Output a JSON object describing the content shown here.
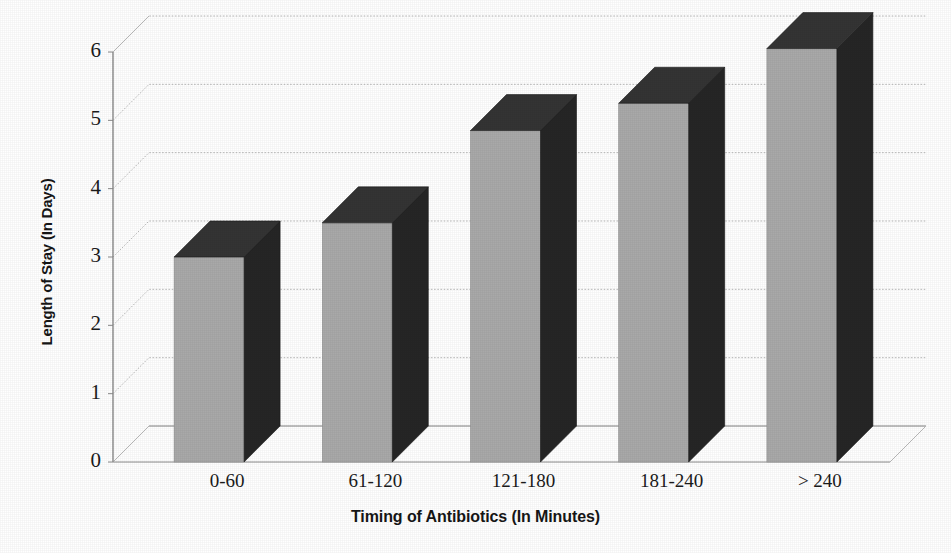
{
  "chart_data": {
    "type": "bar",
    "title": "",
    "subtitle": "",
    "xlabel": "Timing of Antibiotics (In Minutes)",
    "ylabel": "Length of Stay (In Days)",
    "categories": [
      "0-60",
      "61-120",
      "121-180",
      "181-240",
      "> 240"
    ],
    "values": [
      3.0,
      3.5,
      4.85,
      5.25,
      6.05
    ],
    "series": [
      {
        "name": "Length of Stay",
        "values": [
          3.0,
          3.5,
          4.85,
          5.25,
          6.05
        ]
      }
    ],
    "ylim": [
      0,
      6
    ],
    "yticks": [
      0,
      1,
      2,
      3,
      4,
      5,
      6
    ],
    "ytick_labels": [
      "0",
      "1",
      "2",
      "3",
      "4",
      "5",
      "6"
    ],
    "grid": true,
    "grid_axis": "y",
    "legend": false,
    "legend_position": "none",
    "style_3d": true,
    "colors": {
      "bar_front": "#a9a9a9",
      "bar_side": "#262626",
      "bar_top": "#343434",
      "gridline": "#b9b9b9",
      "axis": "#8a8a8a",
      "text": "#1b1b1b",
      "background": "#ffffff"
    }
  },
  "axis": {
    "y_title": "Length of Stay (In Days)",
    "x_title": "Timing of Antibiotics (In Minutes)"
  }
}
